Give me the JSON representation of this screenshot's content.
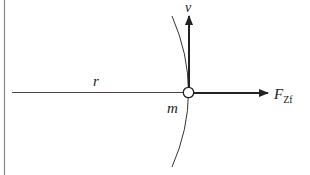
{
  "diagram": {
    "labels": {
      "velocity": "v",
      "radius": "r",
      "mass": "m",
      "force_main": "F",
      "force_sub": "Zf"
    },
    "colors": {
      "line": "#222222",
      "border": "#888888",
      "background": "#ffffff"
    }
  }
}
